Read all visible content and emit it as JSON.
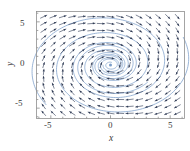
{
  "chart_data": {
    "type": "scatter",
    "subtype": "direction-field-phase-portrait",
    "title": "",
    "xlabel": "x",
    "ylabel": "y",
    "xlim": [
      -6.2,
      6.2
    ],
    "ylim": [
      -6.2,
      6.2
    ],
    "xticks": [
      -5,
      0,
      5
    ],
    "yticks": [
      -5,
      0,
      5
    ],
    "xtick_labels": [
      "-5",
      "0",
      "5"
    ],
    "ytick_labels": [
      "-5",
      "0",
      "5"
    ],
    "grid": false,
    "legend": "none",
    "frame": "box",
    "equilibrium": {
      "x": 0,
      "y": 0,
      "kind": "stable spiral sink"
    },
    "rotation": "clockwise",
    "vector_field": {
      "u_formula": "0.22*x + 1.00*y",
      "v_formula": "-1.00*x + 0.22*y",
      "grid_nx": 15,
      "grid_ny": 15,
      "grid_x_min": -5.6,
      "grid_x_max": 5.6,
      "grid_y_min": -5.6,
      "grid_y_max": 5.6,
      "arrow_color": "#2f3b55",
      "arrow_length": 0.62,
      "normalized": true
    },
    "trajectories": [
      {
        "name": "outer-spiral",
        "start_x": 6.1,
        "start_y": 3.2,
        "turns": 3.1,
        "decay": 0.118,
        "color": "#7b9ec9"
      },
      {
        "name": "mid-spiral",
        "start_x": -5.4,
        "start_y": -4.6,
        "turns": 2.7,
        "decay": 0.118,
        "color": "#7b9ec9"
      },
      {
        "name": "inner-spiral",
        "start_x": 3.1,
        "start_y": -2.0,
        "turns": 2.4,
        "decay": 0.118,
        "color": "#7b9ec9"
      },
      {
        "name": "core-spiral",
        "start_x": -1.3,
        "start_y": 0.95,
        "turns": 2.2,
        "decay": 0.118,
        "color": "#7b9ec9"
      }
    ],
    "series_colors": {
      "trajectory": "#7b9ec9",
      "arrow": "#2f3b55",
      "axis": "#8e8e8e",
      "text": "#3a3a3a"
    }
  },
  "axes": {
    "x_title": "x",
    "y_title": "y",
    "x_tick_0": "-5",
    "x_tick_1": "0",
    "x_tick_2": "5",
    "y_tick_0": "5",
    "y_tick_1": "0",
    "y_tick_2": "-5"
  }
}
